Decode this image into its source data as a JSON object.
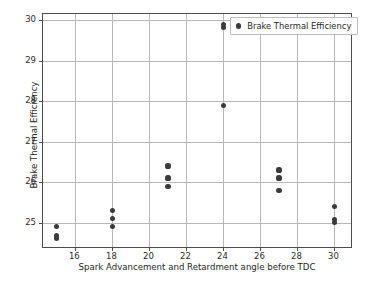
{
  "chart_data": {
    "type": "scatter",
    "title": "",
    "xlabel": "Spark Advancement and Retardment angle before TDC",
    "ylabel": "Brake Thermal Efficiency",
    "xlim": [
      14.25,
      31.0
    ],
    "ylim": [
      24.35,
      30.15
    ],
    "xticks": [
      16,
      18,
      20,
      22,
      24,
      26,
      28,
      30
    ],
    "yticks": [
      25,
      26,
      27,
      28,
      29,
      30
    ],
    "grid": true,
    "legend_position": "upper right",
    "marker_color": "#3b3b3b",
    "series": [
      {
        "name": "Brake Thermal Efficiency",
        "points": [
          [
            15,
            24.9
          ],
          [
            15,
            24.68
          ],
          [
            15,
            24.62
          ],
          [
            18,
            25.3
          ],
          [
            18,
            25.1
          ],
          [
            18,
            24.9
          ],
          [
            21,
            26.4
          ],
          [
            21,
            26.1
          ],
          [
            21,
            25.9
          ],
          [
            24,
            29.9
          ],
          [
            24,
            29.82
          ],
          [
            24,
            27.9
          ],
          [
            27,
            26.3
          ],
          [
            27,
            26.1
          ],
          [
            27,
            25.8
          ],
          [
            30,
            25.4
          ],
          [
            30,
            25.07
          ],
          [
            30,
            25.0
          ]
        ]
      }
    ]
  },
  "legend": {
    "label": "Brake Thermal Efficiency"
  },
  "caption": {
    "text": ""
  }
}
